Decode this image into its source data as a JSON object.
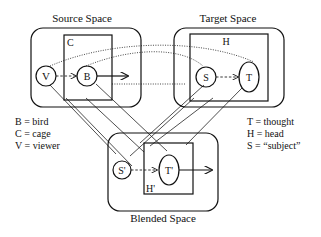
{
  "diagram": {
    "spaces": {
      "source": {
        "title": "Source Space",
        "frame_label": "C",
        "nodes": [
          "V",
          "B"
        ]
      },
      "target": {
        "title": "Target Space",
        "frame_label": "H",
        "nodes": [
          "S",
          "T"
        ]
      },
      "blended": {
        "title": "Blended Space",
        "frame_label": "H'",
        "nodes": [
          "S'",
          "T'"
        ]
      }
    },
    "legend_left": [
      "B = bird",
      "C = cage",
      "V = viewer"
    ],
    "legend_right": [
      "T = thought",
      "H = head",
      "S = “subject”"
    ]
  }
}
